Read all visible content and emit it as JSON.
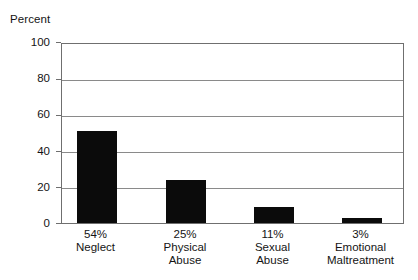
{
  "chart_data": {
    "type": "bar",
    "title": "",
    "subtitle": "",
    "xlabel": "",
    "ylabel": "Percent",
    "ylim": [
      0,
      100
    ],
    "ytick_labels": [
      "0",
      "20",
      "40",
      "60",
      "80",
      "100"
    ],
    "ytick_values": [
      0,
      20,
      40,
      60,
      80,
      100
    ],
    "grid": true,
    "legend": false,
    "legend_position": "none",
    "bar_color": "#0b0b0b",
    "axis_color": "#6f6f6f",
    "grid_color": "#8a8a8a",
    "categories": [
      "54%\nNeglect",
      "25%\nPhysical\nAbuse",
      "11%\nSexual\nAbuse",
      "3%\nEmotional\nMaltreatment"
    ],
    "values": [
      51,
      24,
      9,
      3
    ],
    "bars": [
      {
        "value": 51,
        "percent_label": "54%",
        "name_lines": [
          "Neglect"
        ]
      },
      {
        "value": 24,
        "percent_label": "25%",
        "name_lines": [
          "Physical",
          "Abuse"
        ]
      },
      {
        "value": 9,
        "percent_label": "11%",
        "name_lines": [
          "Sexual",
          "Abuse"
        ]
      },
      {
        "value": 3,
        "percent_label": "3%",
        "name_lines": [
          "Emotional",
          "Maltreatment"
        ]
      }
    ]
  }
}
